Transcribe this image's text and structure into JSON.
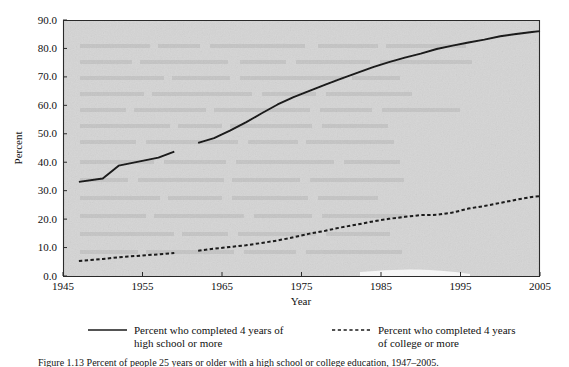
{
  "figure": {
    "caption": "Figure 1.13   Percent of people 25 years or older with a high school or college education, 1947–2005."
  },
  "chart_data": {
    "type": "line",
    "title": "",
    "xlabel": "Year",
    "ylabel": "Percent",
    "xlim": [
      1945,
      2005
    ],
    "ylim": [
      0.0,
      90.0
    ],
    "grid": false,
    "legend_position": "below",
    "xticks": [
      "1945",
      "1955",
      "1965",
      "1975",
      "1985",
      "1995",
      "2005"
    ],
    "xtick_values": [
      1945,
      1955,
      1965,
      1975,
      1985,
      1995,
      2005
    ],
    "yticks": [
      "0.0",
      "10.0",
      "20.0",
      "30.0",
      "40.0",
      "50.0",
      "60.0",
      "70.0",
      "80.0",
      "90.0"
    ],
    "ytick_values": [
      0.0,
      10.0,
      20.0,
      30.0,
      40.0,
      50.0,
      60.0,
      70.0,
      80.0,
      90.0
    ],
    "series": [
      {
        "name": "Percent who completed 4 years of high school or more",
        "style": "solid",
        "color": "#1a1a1a",
        "segments": [
          {
            "x": [
              1947,
              1950,
              1952,
              1957,
              1959
            ],
            "y": [
              33.1,
              34.3,
              38.8,
              41.6,
              43.7
            ]
          },
          {
            "x": [
              1962,
              1964,
              1966,
              1968,
              1970,
              1972,
              1974,
              1976,
              1978,
              1980,
              1982,
              1984,
              1986,
              1988,
              1990,
              1992,
              1994,
              1996,
              1998,
              2000,
              2002,
              2004,
              2005
            ],
            "y": [
              46.8,
              48.5,
              51.1,
              54.0,
              57.2,
              60.3,
              62.9,
              65.1,
              67.3,
              69.4,
              71.4,
              73.4,
              75.2,
              76.8,
              78.2,
              79.8,
              81.0,
              82.1,
              83.1,
              84.3,
              85.1,
              85.8,
              86.1
            ]
          }
        ]
      },
      {
        "name": "Percent who completed 4 years of college or more",
        "style": "dashed",
        "color": "#1a1a1a",
        "segments": [
          {
            "x": [
              1947,
              1950,
              1952,
              1957,
              1959
            ],
            "y": [
              5.3,
              6.0,
              6.6,
              7.6,
              8.1
            ]
          },
          {
            "x": [
              1962,
              1964,
              1966,
              1968,
              1970,
              1972,
              1974,
              1976,
              1978,
              1980,
              1982,
              1984,
              1986,
              1988,
              1990,
              1992,
              1994,
              1996,
              1998,
              2000,
              2002,
              2004,
              2005
            ],
            "y": [
              8.9,
              9.6,
              10.2,
              10.8,
              11.6,
              12.5,
              13.6,
              14.9,
              15.9,
              17.1,
              18.1,
              19.2,
              20.1,
              20.8,
              21.4,
              21.5,
              22.3,
              23.7,
              24.6,
              25.7,
              26.8,
              27.8,
              28.1
            ]
          }
        ]
      }
    ],
    "annotations": {
      "break_note": "Data gap between 1959 and 1962"
    }
  },
  "legend": {
    "items": [
      {
        "style": "solid",
        "line1": "Percent who completed 4 years of",
        "line2": "high school or more"
      },
      {
        "style": "dashed",
        "line1": "Percent who completed 4 years",
        "line2": "of college or more"
      }
    ]
  },
  "colors": {
    "plot_background": "#d5d5d5",
    "line": "#1a1a1a",
    "axis": "#2a2a2a",
    "text": "#111111",
    "page_background": "#ffffff"
  }
}
